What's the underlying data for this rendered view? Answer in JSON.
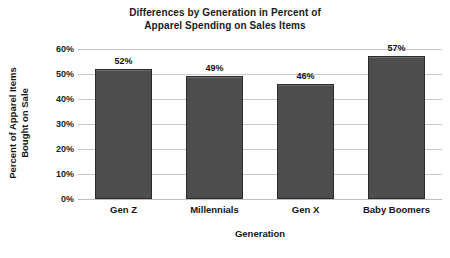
{
  "chart_data": {
    "type": "bar",
    "title": "Differences by Generation in Percent of Apparel Spending on Sales Items",
    "title_lines": [
      "Differences by Generation in Percent of",
      "Apparel Spending on Sales Items"
    ],
    "xlabel": "Generation",
    "ylabel": "Percent of Apparel Items Bought on Sale",
    "ylabel_lines": [
      "Percent of Apparel Items",
      "Bought on Sale"
    ],
    "categories": [
      "Gen Z",
      "Millennials",
      "Gen X",
      "Baby Boomers"
    ],
    "values": [
      52,
      49,
      46,
      57
    ],
    "value_labels": [
      "52%",
      "49%",
      "46%",
      "57%"
    ],
    "ylim": [
      0,
      60
    ],
    "ytick_values": [
      0,
      10,
      20,
      30,
      40,
      50,
      60
    ],
    "ytick_labels": [
      "0%",
      "10%",
      "20%",
      "30%",
      "40%",
      "50%",
      "60%"
    ],
    "grid": true,
    "legend": "none",
    "bar_color": "#4d4d4d",
    "bar_border_color": "#2b2b2b",
    "gridline_color": "#c8c8c8",
    "background_color": "#ffffff",
    "text_color": "#141414"
  }
}
